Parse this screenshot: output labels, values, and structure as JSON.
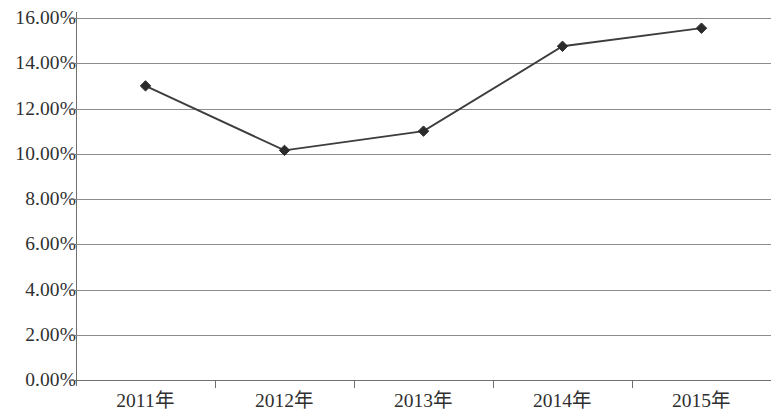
{
  "chart_data": {
    "type": "line",
    "title": "",
    "subtitle": "",
    "xlabel": "",
    "ylabel": "",
    "categories": [
      "2011年",
      "2012年",
      "2013年",
      "2014年",
      "2015年"
    ],
    "values": [
      13.0,
      10.15,
      11.0,
      14.75,
      15.55
    ],
    "value_format": "percent",
    "ylim": [
      0,
      16
    ],
    "ytick_step": 2,
    "ytick_labels": [
      "16.00%",
      "14.00%",
      "12.00%",
      "10.00%",
      "8.00%",
      "6.00%",
      "4.00%",
      "2.00%",
      "0.00%"
    ],
    "ytick_values": [
      16,
      14,
      12,
      10,
      8,
      6,
      4,
      2,
      0
    ],
    "grid": true,
    "grid_axis": "y",
    "legend": false,
    "legend_position": "none",
    "series": [
      {
        "name": "",
        "marker": "diamond",
        "line_color": "#3d3d3d",
        "marker_color": "#2b2b2b",
        "values": [
          13.0,
          10.15,
          11.0,
          14.75,
          15.55
        ]
      }
    ],
    "annotations": [],
    "colors": {
      "background": "#ffffff",
      "gridline": "#8c8c8c",
      "axis": "#6f6f6f",
      "text": "#2f2f2f",
      "series_line": "#3d3d3d",
      "series_marker": "#2b2b2b"
    }
  }
}
